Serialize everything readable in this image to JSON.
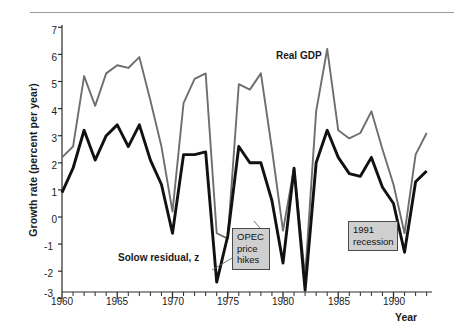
{
  "figure": {
    "ylabel": "Growth rate (percent per year)",
    "xlabel": "Year",
    "series_label_gdp": "Real GDP",
    "series_label_solow": "Solow residual, z"
  },
  "annotations": [
    {
      "id": "opec",
      "lines": [
        "OPEC",
        "price",
        "hikes"
      ],
      "text": "OPEC price hikes"
    },
    {
      "id": "recession1991",
      "lines": [
        "1991",
        "recession"
      ],
      "text": "1991 recession"
    }
  ],
  "colors": {
    "gdp_line": "#6e6e6e",
    "solow_line": "#111111",
    "axis": "#2b2b2b",
    "anno_fill": "#cfcfcf",
    "anno_border": "#4a4a4a",
    "background": "#ffffff"
  },
  "chart_data": {
    "type": "line",
    "title": "",
    "xlabel": "Year",
    "ylabel": "Growth rate (percent per year)",
    "xlim": [
      1960,
      1993
    ],
    "ylim": [
      -3,
      7
    ],
    "yticks": [
      -3,
      -2,
      -1,
      0,
      1,
      2,
      3,
      4,
      5,
      6,
      7
    ],
    "xticks": [
      1960,
      1965,
      1970,
      1975,
      1980,
      1985,
      1990
    ],
    "xtick_labels": [
      "1960",
      "1965",
      "1970",
      "1975",
      "1980",
      "1985",
      "1990"
    ],
    "minor_xticks_every": 1,
    "grid": false,
    "legend": "inline-labels",
    "x": [
      1960,
      1961,
      1962,
      1963,
      1964,
      1965,
      1966,
      1967,
      1968,
      1969,
      1970,
      1971,
      1972,
      1973,
      1974,
      1975,
      1976,
      1977,
      1978,
      1979,
      1980,
      1981,
      1982,
      1983,
      1984,
      1985,
      1986,
      1987,
      1988,
      1989,
      1990,
      1991,
      1992,
      1993
    ],
    "series": [
      {
        "name": "Real GDP",
        "color": "#6e6e6e",
        "values": [
          2.2,
          2.6,
          5.2,
          4.1,
          5.3,
          5.6,
          5.5,
          5.9,
          4.3,
          2.6,
          0.2,
          4.2,
          5.1,
          5.3,
          -0.6,
          -0.8,
          4.9,
          4.7,
          5.3,
          2.5,
          -0.5,
          1.8,
          -2.2,
          3.9,
          6.2,
          3.2,
          2.9,
          3.1,
          3.9,
          2.5,
          1.2,
          -0.6,
          2.3,
          3.1
        ]
      },
      {
        "name": "Solow residual, z",
        "color": "#111111",
        "values": [
          0.9,
          1.8,
          3.2,
          2.1,
          3.0,
          3.4,
          2.6,
          3.4,
          2.1,
          1.2,
          -0.6,
          2.3,
          2.3,
          2.4,
          -2.4,
          -0.7,
          2.6,
          2.0,
          2.0,
          0.6,
          -1.7,
          1.8,
          -2.7,
          2.0,
          3.2,
          2.2,
          1.6,
          1.5,
          2.2,
          1.1,
          0.5,
          -1.3,
          1.3,
          1.7
        ]
      }
    ],
    "annotations": [
      {
        "text": "OPEC price hikes",
        "points_to_x": 1974,
        "points_to_y": -2.4
      },
      {
        "text": "1991 recession",
        "points_to_x": 1991,
        "points_to_y": -1.3
      }
    ]
  }
}
